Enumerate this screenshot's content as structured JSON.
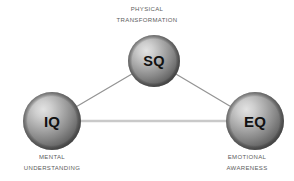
{
  "diagram": {
    "background_color": "#ffffff",
    "label_color": "#5c5c5c",
    "node_text_color": "#111111",
    "line_color": "#8e8e8e",
    "base_line_color": "#c9c9c9",
    "sphere_highlight_color": "#d5d5d5",
    "sphere_mid_color": "#9a9a9a",
    "sphere_shadow_color": "#4e4e4e",
    "nodes": [
      {
        "id": "sq",
        "label": "SQ",
        "cx": 154,
        "cy": 61,
        "r": 26,
        "caption_lines": [
          "Physical",
          "Transformation"
        ]
      },
      {
        "id": "iq",
        "label": "IQ",
        "cx": 52,
        "cy": 121,
        "r": 29,
        "caption_lines": [
          "Mental",
          "Understanding"
        ]
      },
      {
        "id": "eq",
        "label": "EQ",
        "cx": 255,
        "cy": 121,
        "r": 29,
        "caption_lines": [
          "Emotional",
          "Awareness"
        ]
      }
    ],
    "edges": [
      {
        "id": "iq-sq",
        "from": "iq",
        "to": "sq"
      },
      {
        "id": "sq-eq",
        "from": "sq",
        "to": "eq"
      },
      {
        "id": "iq-eq",
        "from": "iq",
        "to": "eq"
      }
    ],
    "captions": {
      "physical_transformation": {
        "line1": "Physical",
        "line2": "Transformation"
      },
      "mental_understanding": {
        "line1": "Mental",
        "line2": "Understanding"
      },
      "emotional_awareness": {
        "line1": "Emotional",
        "line2": "Awareness"
      }
    },
    "node_labels": {
      "sq": "SQ",
      "iq": "IQ",
      "eq": "EQ"
    }
  }
}
